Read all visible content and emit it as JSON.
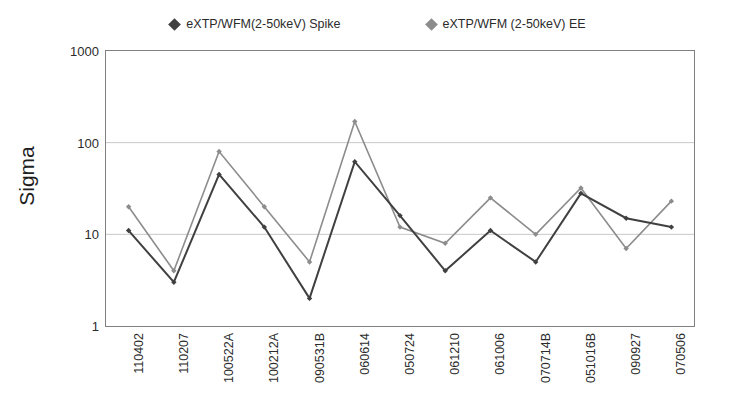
{
  "chart_data": {
    "type": "line",
    "title": "",
    "xlabel": "",
    "ylabel": "Sigma",
    "yscale": "log",
    "ylim": [
      1,
      1000
    ],
    "grid": "horizontal",
    "legend_position": "top",
    "y_ticks": [
      "1000",
      "100",
      "10",
      "1"
    ],
    "y_tick_values": [
      1000,
      100,
      10,
      1
    ],
    "categories": [
      "110402",
      "110207",
      "100522A",
      "100212A",
      "090531B",
      "060614",
      "050724",
      "061210",
      "061006",
      "070714B",
      "051016B",
      "090927",
      "070506"
    ],
    "series": [
      {
        "name": "eXTP/WFM(2-50keV) Spike",
        "color": "#404040",
        "marker": "diamond",
        "values": [
          11,
          3,
          45,
          12,
          2,
          62,
          16,
          4,
          11,
          5,
          28,
          15,
          12
        ]
      },
      {
        "name": "eXTP/WFM (2-50keV) EE",
        "color": "#8c8c8c",
        "marker": "diamond",
        "values": [
          20,
          4,
          80,
          20,
          5,
          170,
          12,
          8,
          25,
          10,
          32,
          7,
          23
        ]
      }
    ]
  },
  "legend": {
    "entries": [
      {
        "label": "eXTP/WFM(2-50keV) Spike",
        "color": "#404040"
      },
      {
        "label": "eXTP/WFM (2-50keV) EE",
        "color": "#8c8c8c"
      }
    ]
  },
  "axis": {
    "y_title": "Sigma"
  },
  "colors": {
    "spike": "#404040",
    "ee": "#8c8c8c",
    "gridline": "#c8c8c8",
    "border": "#7f7f7f",
    "text": "#2b2b2b"
  }
}
